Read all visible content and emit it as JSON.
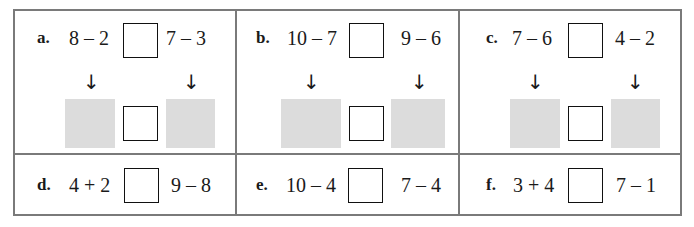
{
  "worksheet": {
    "problems": [
      {
        "label": "a.",
        "left": "8 – 2",
        "right": "7 – 3",
        "has_workspace": true
      },
      {
        "label": "b.",
        "left": "10 – 7",
        "right": "9 – 6",
        "has_workspace": true
      },
      {
        "label": "c.",
        "left": "7 – 6",
        "right": "4 – 2",
        "has_workspace": true
      },
      {
        "label": "d.",
        "left": "4 + 2",
        "right": "9 – 8",
        "has_workspace": false
      },
      {
        "label": "e.",
        "left": "10 – 4",
        "right": "7 – 4",
        "has_workspace": false
      },
      {
        "label": "f.",
        "left": "3 + 4",
        "right": "7 – 1",
        "has_workspace": false
      }
    ],
    "arrow_glyph": "↓",
    "colors": {
      "border": "#7a7a7a",
      "workspace_fill": "#dcdcdc",
      "text": "#1a1a1a"
    }
  }
}
